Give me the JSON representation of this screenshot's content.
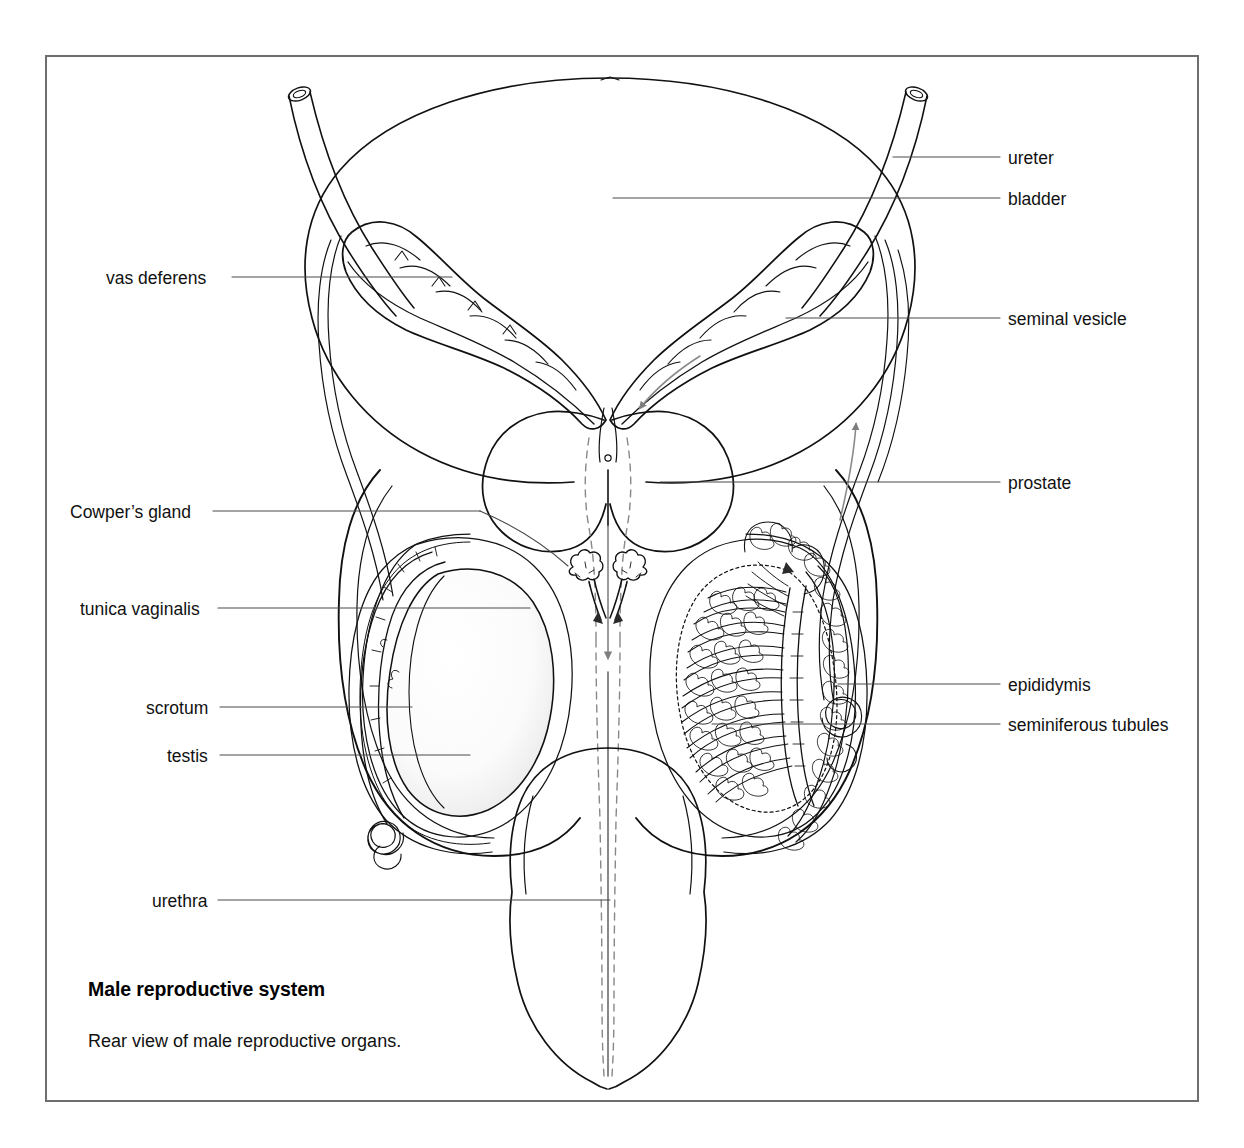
{
  "figure": {
    "title": "Male reproductive system",
    "caption": "Rear view of male reproductive organs.",
    "view": "Rear view",
    "frame_color": "#6e6e6e",
    "ink_color": "#111111",
    "flow_arrow_color": "#808080",
    "background": "#ffffff"
  },
  "labels": {
    "left": [
      {
        "key": "vas-deferens",
        "text": "vas deferens",
        "x": 106,
        "y": 270,
        "leader_x1": 232,
        "leader_x2": 452,
        "leader_y": 277
      },
      {
        "key": "cowpers-gland",
        "text": "Cowper’s gland",
        "x": 70,
        "y": 504,
        "leader_x1": 213,
        "leader_x2": 480,
        "leader_y": 511
      },
      {
        "key": "tunica-vaginalis",
        "text": "tunica vaginalis",
        "x": 80,
        "y": 601,
        "leader_x1": 218,
        "leader_x2": 530,
        "leader_y": 608
      },
      {
        "key": "scrotum",
        "text": "scrotum",
        "x": 146,
        "y": 700,
        "leader_x1": 220,
        "leader_x2": 412,
        "leader_y": 707
      },
      {
        "key": "testis",
        "text": "testis",
        "x": 167,
        "y": 748,
        "leader_x1": 220,
        "leader_x2": 470,
        "leader_y": 755
      },
      {
        "key": "urethra",
        "text": "urethra",
        "x": 152,
        "y": 893,
        "leader_x1": 218,
        "leader_x2": 610,
        "leader_y": 900
      }
    ],
    "right": [
      {
        "key": "ureter",
        "text": "ureter",
        "x": 1008,
        "y": 150,
        "leader_x1": 893,
        "leader_x2": 1000,
        "leader_y": 157
      },
      {
        "key": "bladder",
        "text": "bladder",
        "x": 1008,
        "y": 191,
        "leader_x1": 613,
        "leader_x2": 1000,
        "leader_y": 198
      },
      {
        "key": "seminal-vesicle",
        "text": "seminal vesicle",
        "x": 1008,
        "y": 311,
        "leader_x1": 786,
        "leader_x2": 1000,
        "leader_y": 318
      },
      {
        "key": "prostate",
        "text": "prostate",
        "x": 1008,
        "y": 475,
        "leader_x1": 660,
        "leader_x2": 1000,
        "leader_y": 482
      },
      {
        "key": "epididymis",
        "text": "epididymis",
        "x": 1008,
        "y": 677,
        "leader_x1": 838,
        "leader_x2": 1000,
        "leader_y": 684
      },
      {
        "key": "seminiferous-tubules",
        "text": "seminiferous tubules",
        "x": 1008,
        "y": 717,
        "leader_x1": 712,
        "leader_x2": 1000,
        "leader_y": 724
      }
    ]
  },
  "structures": [
    "bladder",
    "left ureter",
    "right ureter",
    "left seminal vesicle",
    "right seminal vesicle",
    "left vas deferens",
    "right vas deferens",
    "prostate",
    "ejaculatory ducts",
    "left Cowper's gland",
    "right Cowper's gland",
    "urethra",
    "left testis",
    "right testis",
    "left epididymis",
    "right epididymis",
    "seminiferous tubules",
    "tunica vaginalis",
    "scrotum",
    "penis shaft"
  ],
  "flow_arrows": [
    {
      "name": "vas-deferens-flow-right-up",
      "direction": "up",
      "note": "sperm ascending right vas deferens"
    },
    {
      "name": "seminal-vesicle-flow-down",
      "direction": "down",
      "note": "secretion toward ejaculatory duct"
    },
    {
      "name": "urethra-flow-down",
      "direction": "down",
      "note": "flow down urethra"
    }
  ]
}
